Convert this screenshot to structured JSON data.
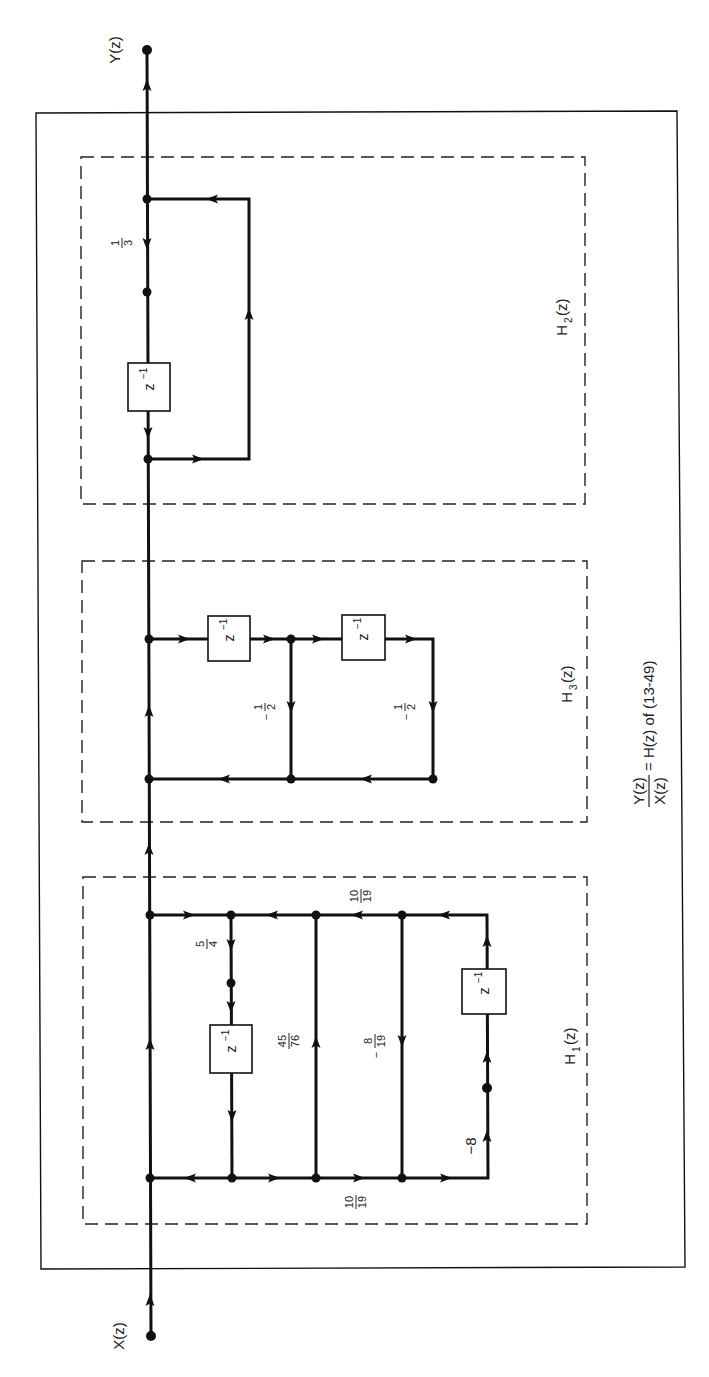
{
  "figure": {
    "orientation": "rotated-90-ccw",
    "input_label": "X(z)",
    "output_label": "Y(z)",
    "equation": {
      "numerator": "Y(z)",
      "denominator": "X(z)",
      "rhs": "= H(z) of (13-49)"
    },
    "sections": [
      {
        "id": "H1",
        "label": "H",
        "subscript": "1",
        "arg": "(z)",
        "delay_label": "z",
        "delay_exp": "−1",
        "gains": {
          "top_left": {
            "num": "5",
            "den": "4",
            "sign": ""
          },
          "middle": {
            "num": "45",
            "den": "76",
            "sign": ""
          },
          "right_branch": {
            "num": "8",
            "den": "19",
            "sign": "−"
          },
          "top_rail": {
            "num": "10",
            "den": "19",
            "sign": ""
          },
          "bottom_rail": {
            "num": "10",
            "den": "19",
            "sign": ""
          },
          "feedback": "−8"
        }
      },
      {
        "id": "H3",
        "label": "H",
        "subscript": "3",
        "arg": "(z)",
        "delay_label": "z",
        "delay_exp": "−1",
        "gains": {
          "first": {
            "num": "1",
            "den": "2",
            "sign": "−"
          },
          "second": {
            "num": "1",
            "den": "2",
            "sign": "−"
          }
        }
      },
      {
        "id": "H2",
        "label": "H",
        "subscript": "2",
        "arg": "(z)",
        "delay_label": "z",
        "delay_exp": "−1",
        "gains": {
          "forward": {
            "num": "1",
            "den": "3",
            "sign": ""
          }
        }
      }
    ]
  }
}
